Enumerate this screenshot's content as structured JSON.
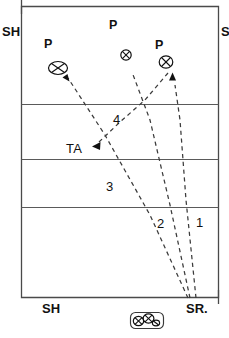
{
  "diagram": {
    "court": {
      "name": "court-rectangle",
      "border_color": "#4a4a4a",
      "divider_count": 3
    },
    "edge_labels": {
      "top_left": "SH",
      "top_right": "S",
      "bottom_left": "SH",
      "bottom_right": "SR."
    },
    "player_labels": [
      {
        "name": "player-p-top-center",
        "text": "P"
      },
      {
        "name": "player-p-left",
        "text": "P"
      },
      {
        "name": "player-p-right",
        "text": "P"
      }
    ],
    "zone_labels": [
      {
        "name": "zone-label-4",
        "text": "4"
      },
      {
        "name": "zone-label-3",
        "text": "3"
      },
      {
        "name": "zone-label-2",
        "text": "2"
      },
      {
        "name": "zone-label-1",
        "text": "1"
      }
    ],
    "target_label": {
      "name": "target-area-label",
      "text": "TA"
    },
    "markers": [
      {
        "name": "ball-marker-left",
        "glyph": "circled-x"
      },
      {
        "name": "ball-marker-center",
        "glyph": "circled-x"
      },
      {
        "name": "ball-marker-right",
        "glyph": "circled-x"
      },
      {
        "name": "bench-marker-a",
        "glyph": "circled-x"
      },
      {
        "name": "bench-marker-b",
        "glyph": "circled-x"
      }
    ],
    "trajectories": [
      {
        "name": "trajectory-1",
        "zone": "1"
      },
      {
        "name": "trajectory-2",
        "zone": "2"
      },
      {
        "name": "trajectory-3",
        "zone": "3"
      },
      {
        "name": "trajectory-4",
        "zone": "4"
      }
    ],
    "colors": {
      "ink": "#111111",
      "line": "#4a4a4a",
      "dash": "#3b3b3b",
      "background": "#ffffff"
    }
  }
}
